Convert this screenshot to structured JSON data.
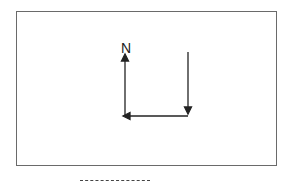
{
  "diagram": {
    "north_label": "N",
    "colors": {
      "stroke": "#222222",
      "frame": "#6a6a6a"
    },
    "arrows": [
      {
        "name": "down-arrow",
        "from": [
          188,
          52
        ],
        "to": [
          188,
          114
        ]
      },
      {
        "name": "left-arrow",
        "from": [
          188,
          116
        ],
        "to": [
          123,
          116
        ]
      },
      {
        "name": "north-arrow",
        "from": [
          125,
          116
        ],
        "to": [
          125,
          54
        ]
      }
    ]
  }
}
